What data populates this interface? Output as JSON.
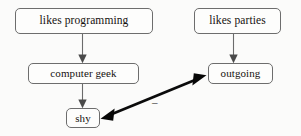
{
  "diagram": {
    "background_color": "#fbfbfa",
    "node_border_color": "#6d6d6d",
    "edge_color": "#6b6b6b",
    "bold_edge_color": "#0b0b0b",
    "nodes": [
      {
        "id": "likes-programming",
        "label": "likes programming"
      },
      {
        "id": "likes-parties",
        "label": "likes parties"
      },
      {
        "id": "computer-geek",
        "label": "computer geek"
      },
      {
        "id": "outgoing",
        "label": "outgoing"
      },
      {
        "id": "shy",
        "label": "shy"
      }
    ],
    "edges": [
      {
        "id": "likes-programming-to-computer-geek",
        "from": "likes programming",
        "to": "computer geek",
        "arrow": "single",
        "label": ""
      },
      {
        "id": "computer-geek-to-shy",
        "from": "computer geek",
        "to": "shy",
        "arrow": "single",
        "label": ""
      },
      {
        "id": "likes-parties-to-outgoing",
        "from": "likes parties",
        "to": "outgoing",
        "arrow": "single",
        "label": ""
      },
      {
        "id": "shy-to-outgoing",
        "from": "shy",
        "to": "outgoing",
        "arrow": "double",
        "label": "–"
      }
    ]
  }
}
